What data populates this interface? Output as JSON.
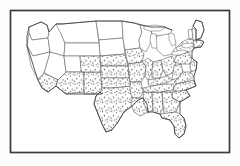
{
  "figure": {
    "title": "United States distribution map",
    "medium": "scanned line drawing",
    "frame": {
      "name": "border-rectangle",
      "stroke_color": "#3a3a3a",
      "fill_color": "#ffffff",
      "x": 10,
      "y": 10,
      "width": 220,
      "height": 143
    },
    "legend_present": false,
    "labels_present": false,
    "colors": {
      "background": "#fdfdfd",
      "border": "#3a3a3a",
      "state_outline": "#5a5a5a",
      "coast_outline": "#3f3f3f",
      "stipple_dot": "#2f2f2f",
      "unshaded_fill": "#ffffff"
    },
    "stipple": {
      "dot_color": "#2f2f2f",
      "dot_radius_px": 0.62,
      "spacing_px": 4.6,
      "jitter_px": 1.5
    }
  },
  "regions": {
    "shaded_label": "stippled",
    "unshaded_label": "blank",
    "shaded_states": [
      "Southern California",
      "Arizona",
      "New Mexico",
      "Texas",
      "Oklahoma",
      "Kansas",
      "Colorado",
      "Missouri",
      "Arkansas",
      "Louisiana",
      "Mississippi",
      "Alabama",
      "Georgia",
      "Florida",
      "South Carolina",
      "North Carolina",
      "Tennessee",
      "Kentucky",
      "Virginia",
      "West Virginia",
      "Ohio",
      "Indiana",
      "Illinois",
      "Iowa",
      "Nebraska",
      "Pennsylvania",
      "New York",
      "New Jersey",
      "Maryland",
      "Delaware",
      "Connecticut",
      "Rhode Island",
      "Massachusetts"
    ],
    "unshaded_states": [
      "Washington",
      "Oregon",
      "Idaho",
      "Montana",
      "Wyoming",
      "Nevada",
      "Northern California",
      "Utah",
      "North Dakota",
      "South Dakota",
      "Minnesota",
      "Wisconsin",
      "Michigan",
      "Maine",
      "Vermont",
      "New Hampshire"
    ]
  },
  "features": {
    "great_lakes": [
      "Lake Superior",
      "Lake Michigan",
      "Lake Huron",
      "Lake Erie",
      "Lake Ontario"
    ],
    "peninsulas": [
      "Florida",
      "Michigan Lower",
      "Michigan Upper",
      "Cape Cod"
    ]
  }
}
